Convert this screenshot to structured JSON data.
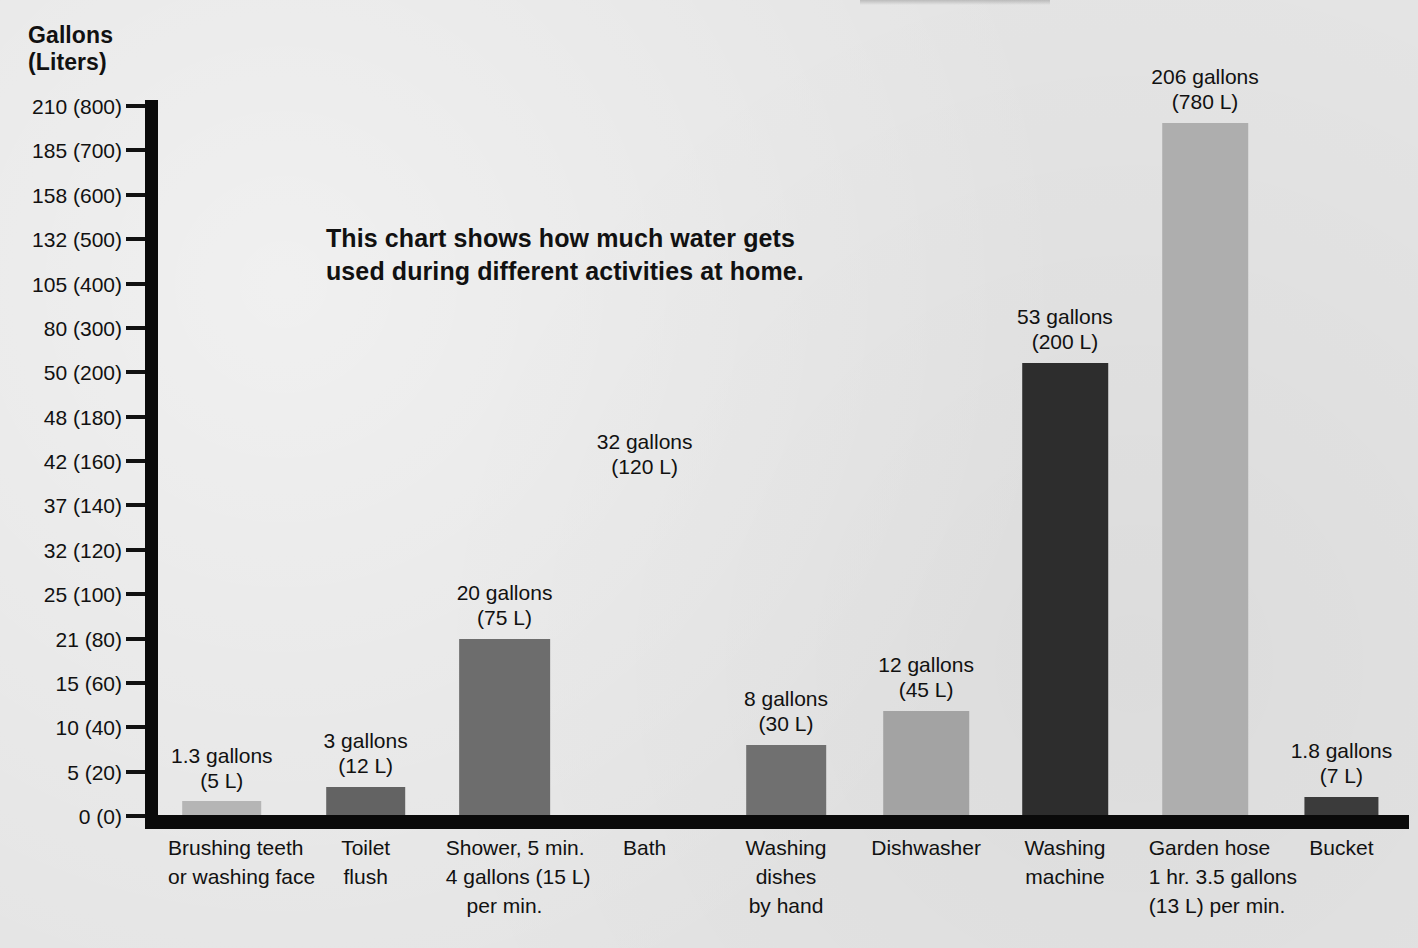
{
  "axis_title": {
    "line1": "Gallons",
    "line2": "(Liters)"
  },
  "blurb": {
    "line1": "This chart shows how much water gets",
    "line2": "used during different activities at home."
  },
  "y_axis": {
    "tick_labels": [
      "210 (800)",
      "185 (700)",
      "158 (600)",
      "132 (500)",
      "105 (400)",
      "80 (300)",
      "50 (200)",
      "48 (180)",
      "42 (160)",
      "37 (140)",
      "32 (120)",
      "25 (100)",
      "21 (80)",
      "15 (60)",
      "10 (40)",
      "5 (20)",
      "0 (0)"
    ]
  },
  "colors": {
    "background": "#e4e4e4",
    "axis": "#0a0a0a",
    "text": "#111111",
    "bar_light": "#b3b3b3",
    "bar_mid": "#9a9a9a",
    "bar_dark": "#6e6e6e",
    "bar_darker": "#5f5f5f",
    "bar_black": "#2b2b2b"
  },
  "chart_data": {
    "type": "bar",
    "title": "This chart shows how much water gets used during different activities at home.",
    "xlabel": "",
    "ylabel": "Gallons (Liters)",
    "grid": false,
    "legend": "none",
    "ytick_labels": [
      "210 (800)",
      "185 (700)",
      "158 (600)",
      "132 (500)",
      "105 (400)",
      "80 (300)",
      "50 (200)",
      "48 (180)",
      "42 (160)",
      "37 (140)",
      "32 (120)",
      "25 (100)",
      "21 (80)",
      "15 (60)",
      "10 (40)",
      "5 (20)",
      "0 (0)"
    ],
    "ytick_gallons": [
      210,
      185,
      158,
      132,
      105,
      80,
      50,
      48,
      42,
      37,
      32,
      25,
      21,
      15,
      10,
      5,
      0
    ],
    "ytick_liters": [
      800,
      700,
      600,
      500,
      400,
      300,
      200,
      180,
      160,
      140,
      120,
      100,
      80,
      60,
      40,
      20,
      0
    ],
    "ylim_liters": [
      0,
      800
    ],
    "note": "Y axis uses a non-linear (compressed upper range) scale. The 'Bath' category shows a value label but no bar is drawn.",
    "categories": [
      "Brushing teeth or washing face",
      "Toilet flush",
      "Shower, 5 min. 4 gallons (15 L) per min.",
      "Bath",
      "Washing dishes by hand",
      "Dishwasher",
      "Washing machine",
      "Garden hose 1 hr. 3.5 gallons (13 L) per min.",
      "Bucket"
    ],
    "values_gallons": [
      1.3,
      3,
      20,
      32,
      8,
      12,
      53,
      206,
      1.8
    ],
    "values_liters": [
      5,
      12,
      75,
      120,
      30,
      45,
      200,
      780,
      7
    ],
    "data_labels": [
      "1.3 gallons (5 L)",
      "3 gallons (12 L)",
      "20 gallons (75 L)",
      "32 gallons (120 L)",
      "8 gallons (30 L)",
      "12 gallons (45 L)",
      "53 gallons (200 L)",
      "206 gallons (780 L)",
      "1.8 gallons (7 L)"
    ]
  },
  "bars": [
    {
      "key": "brushing-teeth",
      "value_line1": "1.3 gallons",
      "value_line2": "(5 L)",
      "cat_line1": "Brushing teeth",
      "cat_line2": "or washing face",
      "cat_line3": "",
      "color": "#b5b5b5",
      "left_pct": 0.8,
      "width_pct": 8.6,
      "bar_width_pct": 74,
      "height_px": 14,
      "has_bar": true,
      "label_bottom_px": 22
    },
    {
      "key": "toilet-flush",
      "value_line1": "3 gallons",
      "value_line2": "(12 L)",
      "cat_line1": "Toilet",
      "cat_line2": "flush",
      "cat_line3": "",
      "color": "#636363",
      "left_pct": 12.3,
      "width_pct": 8.6,
      "bar_width_pct": 74,
      "height_px": 28,
      "has_bar": true,
      "label_bottom_px": 37
    },
    {
      "key": "shower",
      "value_line1": "20 gallons",
      "value_line2": "(75 L)",
      "cat_line1": "Shower, 5 min.",
      "cat_line2": "4 gallons (15 L)",
      "cat_line3": "per min.",
      "color": "#6d6d6d",
      "left_pct": 23.0,
      "width_pct": 9.4,
      "bar_width_pct": 78,
      "height_px": 176,
      "has_bar": true,
      "label_bottom_px": 185
    },
    {
      "key": "bath",
      "value_line1": "32 gallons",
      "value_line2": "(120 L)",
      "cat_line1": "Bath",
      "cat_line2": "",
      "cat_line3": "",
      "color": "#9a9a9a",
      "left_pct": 34.6,
      "width_pct": 8.6,
      "bar_width_pct": 74,
      "height_px": 0,
      "has_bar": false,
      "label_bottom_px": 336
    },
    {
      "key": "washing-dishes",
      "value_line1": "8 gallons",
      "value_line2": "(30 L)",
      "cat_line1": "Washing",
      "cat_line2": "dishes",
      "cat_line3": "by hand",
      "color": "#707070",
      "left_pct": 45.9,
      "width_pct": 8.6,
      "bar_width_pct": 74,
      "height_px": 70,
      "has_bar": true,
      "label_bottom_px": 79
    },
    {
      "key": "dishwasher",
      "value_line1": "12 gallons",
      "value_line2": "(45 L)",
      "cat_line1": "Dishwasher",
      "cat_line2": "",
      "cat_line3": "",
      "color": "#a3a3a3",
      "left_pct": 56.9,
      "width_pct": 9.0,
      "bar_width_pct": 76,
      "height_px": 104,
      "has_bar": true,
      "label_bottom_px": 113
    },
    {
      "key": "washing-machine",
      "value_line1": "53 gallons",
      "value_line2": "(200 L)",
      "cat_line1": "Washing",
      "cat_line2": "machine",
      "cat_line3": "",
      "color": "#2d2d2d",
      "left_pct": 68.0,
      "width_pct": 9.0,
      "bar_width_pct": 76,
      "height_px": 452,
      "has_bar": true,
      "label_bottom_px": 461
    },
    {
      "key": "garden-hose",
      "value_line1": "206 gallons",
      "value_line2": "(780 L)",
      "cat_line1": "Garden hose",
      "cat_line2": "1 hr. 3.5 gallons",
      "cat_line3": "(13 L) per min.",
      "color": "#aeaeae",
      "left_pct": 79.2,
      "width_pct": 9.0,
      "bar_width_pct": 76,
      "height_px": 692,
      "has_bar": true,
      "label_bottom_px": 701
    },
    {
      "key": "bucket",
      "value_line1": "1.8 gallons",
      "value_line2": "(7 L)",
      "cat_line1": "Bucket",
      "cat_line2": "",
      "cat_line3": "",
      "color": "#3b3b3b",
      "left_pct": 90.3,
      "width_pct": 8.6,
      "bar_width_pct": 68,
      "height_px": 18,
      "has_bar": true,
      "label_bottom_px": 27
    }
  ]
}
